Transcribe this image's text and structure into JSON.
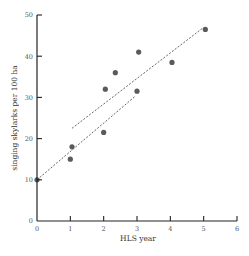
{
  "chart_data": {
    "type": "scatter",
    "title": "",
    "xlabel": "HLS year",
    "ylabel": "singing skylarks per 100 ha",
    "xlim": [
      0,
      6
    ],
    "ylim": [
      0,
      50
    ],
    "x_ticks": [
      "0",
      "1",
      "2",
      "3",
      "4",
      "5",
      "6"
    ],
    "y_ticks": [
      "0",
      "10",
      "20",
      "30",
      "40",
      "50"
    ],
    "grid": false,
    "legend": null,
    "series": [
      {
        "name": "observations",
        "type": "scatter",
        "color": "#5a5a5a",
        "points": [
          {
            "x": 0,
            "y": 10
          },
          {
            "x": 1,
            "y": 15
          },
          {
            "x": 1.05,
            "y": 18
          },
          {
            "x": 2,
            "y": 21.5
          },
          {
            "x": 2.05,
            "y": 32
          },
          {
            "x": 2.35,
            "y": 36
          },
          {
            "x": 3,
            "y": 31.5
          },
          {
            "x": 3.05,
            "y": 41
          },
          {
            "x": 4.05,
            "y": 38.5
          },
          {
            "x": 5.05,
            "y": 46.5
          }
        ]
      },
      {
        "name": "trend line (upper)",
        "type": "line",
        "style": "dashed",
        "color": "#666666",
        "points": [
          {
            "x": 1.05,
            "y": 22.5
          },
          {
            "x": 5.0,
            "y": 47
          }
        ]
      },
      {
        "name": "trend line (lower)",
        "type": "line",
        "style": "dashed",
        "color": "#666666",
        "points": [
          {
            "x": 0,
            "y": 10
          },
          {
            "x": 2.95,
            "y": 30.3
          }
        ]
      }
    ]
  },
  "colors": {
    "axis": "#222222",
    "points": "#5a5a5a",
    "lines": "#666666",
    "tick_labels": "#555555"
  }
}
